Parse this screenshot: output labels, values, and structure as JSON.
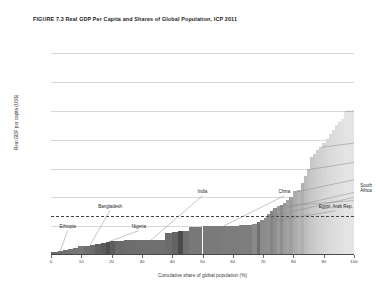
{
  "figure": {
    "title": "FIGURE 7.3 Real GDP Per Capita and Shares of Global Population, ICP 2011"
  },
  "chart_data": {
    "type": "bar",
    "title": "FIGURE 7.3 Real GDP Per Capita and Shares of Global Population, ICP 2011",
    "xlabel": "Cumulative share of global population (%)",
    "ylabel": "Real GDP per capita (US$)",
    "xlim": [
      0,
      100
    ],
    "ylim": [
      0,
      75000
    ],
    "grid": true,
    "legend": "none",
    "xticks": [
      0,
      10,
      20,
      30,
      40,
      50,
      60,
      70,
      80,
      90,
      100
    ],
    "xtick_labels": [
      "0",
      "10",
      "20",
      "30",
      "40",
      "50",
      "60",
      "70",
      "80",
      "90",
      "100"
    ],
    "yticks": [
      0,
      10000,
      20000,
      30000,
      40000,
      50000,
      60000,
      70000
    ],
    "ytick_labels": [
      "0",
      "10,000",
      "20,000",
      "30,000",
      "40,000",
      "50,000",
      "60,000",
      "70,000"
    ],
    "reference_line": {
      "label": "World average",
      "value_label": "13,460",
      "value": 13460,
      "style": "dashed"
    },
    "x_units": "cumulative share of global population (%)",
    "y_units": "Real GDP per capita (US$)",
    "note": "Skyline/Pen's-parade chart: each bar's width is a country's share of global population, height is its real GDP per capita. Bars sorted ascending by GDP per capita; shading lightens left to right.",
    "bars": [
      {
        "x0": 0.0,
        "x1": 2.2,
        "value": 1100,
        "shade": "#6b6b6b"
      },
      {
        "x0": 2.2,
        "x1": 4.0,
        "value": 1450,
        "shade": "#6e6e6e"
      },
      {
        "x0": 4.0,
        "x1": 5.6,
        "value": 1750,
        "shade": "#707070"
      },
      {
        "x0": 5.6,
        "x1": 7.2,
        "value": 2150,
        "shade": "#737373"
      },
      {
        "x0": 7.2,
        "x1": 9.0,
        "value": 2600,
        "shade": "#757575"
      },
      {
        "x0": 9.0,
        "x1": 11.0,
        "value": 3000,
        "shade": "#787878"
      },
      {
        "x0": 11.0,
        "x1": 12.8,
        "value": 3300,
        "shade": "#6f6f6f"
      },
      {
        "x0": 12.8,
        "x1": 14.6,
        "value": 3600,
        "shade": "#6b6b6b"
      },
      {
        "x0": 14.6,
        "x1": 16.4,
        "value": 3900,
        "shade": "#5f5f5f"
      },
      {
        "x0": 16.4,
        "x1": 18.0,
        "value": 4150,
        "shade": "#5a5a5a"
      },
      {
        "x0": 18.0,
        "x1": 19.6,
        "value": 4400,
        "shade": "#4e4e4e"
      },
      {
        "x0": 19.6,
        "x1": 21.0,
        "value": 4700,
        "shade": "#5d5d5d"
      },
      {
        "x0": 21.0,
        "x1": 24.0,
        "value": 4900,
        "shade": "#6a6a6a"
      },
      {
        "x0": 24.0,
        "x1": 28.0,
        "value": 5050,
        "shade": "#6d6d6d"
      },
      {
        "x0": 28.0,
        "x1": 33.0,
        "value": 5150,
        "shade": "#6f6f6f"
      },
      {
        "x0": 33.0,
        "x1": 37.5,
        "value": 5300,
        "shade": "#707070"
      },
      {
        "x0": 37.5,
        "x1": 40.0,
        "value": 7800,
        "shade": "#6c6c6c"
      },
      {
        "x0": 40.0,
        "x1": 41.8,
        "value": 8000,
        "shade": "#636363"
      },
      {
        "x0": 41.8,
        "x1": 43.5,
        "value": 8200,
        "shade": "#4a4a4a"
      },
      {
        "x0": 43.5,
        "x1": 45.5,
        "value": 8400,
        "shade": "#707070"
      },
      {
        "x0": 45.5,
        "x1": 50.0,
        "value": 9900,
        "shade": "#787878"
      },
      {
        "x0": 50.0,
        "x1": 56.0,
        "value": 10050,
        "shade": "#7a7a7a"
      },
      {
        "x0": 56.0,
        "x1": 62.0,
        "value": 10150,
        "shade": "#7c7c7c"
      },
      {
        "x0": 62.0,
        "x1": 66.5,
        "value": 10300,
        "shade": "#7e7e7e"
      },
      {
        "x0": 66.5,
        "x1": 68.0,
        "value": 10700,
        "shade": "#8a8a8a"
      },
      {
        "x0": 68.0,
        "x1": 69.0,
        "value": 11400,
        "shade": "#6e6e6e"
      },
      {
        "x0": 69.0,
        "x1": 70.2,
        "value": 12100,
        "shade": "#8b8b8b"
      },
      {
        "x0": 70.2,
        "x1": 71.2,
        "value": 13000,
        "shade": "#8d8d8d"
      },
      {
        "x0": 71.2,
        "x1": 72.2,
        "value": 14400,
        "shade": "#909090"
      },
      {
        "x0": 72.2,
        "x1": 73.4,
        "value": 15400,
        "shade": "#848484"
      },
      {
        "x0": 73.4,
        "x1": 74.6,
        "value": 16200,
        "shade": "#8e8e8e"
      },
      {
        "x0": 74.6,
        "x1": 75.6,
        "value": 16900,
        "shade": "#9a9a9a"
      },
      {
        "x0": 75.6,
        "x1": 76.6,
        "value": 17500,
        "shade": "#8d8d8d"
      },
      {
        "x0": 76.6,
        "x1": 77.6,
        "value": 18200,
        "shade": "#9c9c9c"
      },
      {
        "x0": 77.6,
        "x1": 78.6,
        "value": 19100,
        "shade": "#a2a2a2"
      },
      {
        "x0": 78.6,
        "x1": 79.8,
        "value": 20100,
        "shade": "#9e9e9e"
      },
      {
        "x0": 79.8,
        "x1": 81.2,
        "value": 22200,
        "shade": "#ababab"
      },
      {
        "x0": 81.2,
        "x1": 82.4,
        "value": 22600,
        "shade": "#b4b4b4"
      },
      {
        "x0": 82.4,
        "x1": 83.4,
        "value": 24900,
        "shade": "#b0b0b0"
      },
      {
        "x0": 83.4,
        "x1": 84.4,
        "value": 27500,
        "shade": "#bcbcbc"
      },
      {
        "x0": 84.4,
        "x1": 85.4,
        "value": 30000,
        "shade": "#c2c2c2"
      },
      {
        "x0": 85.4,
        "x1": 86.6,
        "value": 33900,
        "shade": "#c8c8c8"
      },
      {
        "x0": 86.6,
        "x1": 87.6,
        "value": 35000,
        "shade": "#cbcbcb"
      },
      {
        "x0": 87.6,
        "x1": 88.6,
        "value": 36400,
        "shade": "#cfcfcf"
      },
      {
        "x0": 88.6,
        "x1": 89.6,
        "value": 37600,
        "shade": "#d2d2d2"
      },
      {
        "x0": 89.6,
        "x1": 90.6,
        "value": 38800,
        "shade": "#d5d5d5"
      },
      {
        "x0": 90.6,
        "x1": 91.6,
        "value": 40200,
        "shade": "#d8d8d8"
      },
      {
        "x0": 91.6,
        "x1": 92.6,
        "value": 42000,
        "shade": "#dadada"
      },
      {
        "x0": 92.6,
        "x1": 93.6,
        "value": 43500,
        "shade": "#dcdcdc"
      },
      {
        "x0": 93.6,
        "x1": 94.6,
        "value": 45000,
        "shade": "#dedede"
      },
      {
        "x0": 94.6,
        "x1": 95.6,
        "value": 46200,
        "shade": "#e0e0e0"
      },
      {
        "x0": 95.6,
        "x1": 96.6,
        "value": 47400,
        "shade": "#e2e2e2"
      },
      {
        "x0": 96.6,
        "x1": 100.0,
        "value": 49800,
        "shade": "#e4e4e4"
      }
    ],
    "annotations": [
      {
        "label": "Ethiopia",
        "label_x": 5.5,
        "label_y": 9000,
        "point_x": 3.0,
        "point_y": 1200
      },
      {
        "label": "Bangladesh",
        "label_x": 19.5,
        "label_y": 16100,
        "point_x": 13.0,
        "point_y": 3600
      },
      {
        "label": "Nigeria",
        "label_x": 29.0,
        "label_y": 9000,
        "point_x": 18.3,
        "point_y": 4300
      },
      {
        "label": "India",
        "label_x": 50.0,
        "label_y": 21100,
        "point_x": 33.0,
        "point_y": 5200
      },
      {
        "label": "China",
        "label_x": 77.0,
        "label_y": 21100,
        "point_x": 57.0,
        "point_y": 10100
      },
      {
        "label": "Egypt, Arab Rep.",
        "label_x": 94.0,
        "label_y": 15900,
        "point_x": 67.3,
        "point_y": 10700
      },
      {
        "label": "South\nAfrica",
        "label_x": 104.0,
        "label_y": 21500,
        "point_x": 70.6,
        "point_y": 12900
      },
      {
        "label": "Brazil",
        "label_x": 111.0,
        "label_y": 24900,
        "point_x": 72.8,
        "point_y": 15200
      },
      {
        "label": "Mexico",
        "label_x": 124.0,
        "label_y": 21300,
        "point_x": 76.0,
        "point_y": 17000
      },
      {
        "label": "Russian Fed.",
        "label_x": 123.0,
        "label_y": 31700,
        "point_x": 80.5,
        "point_y": 21800
      },
      {
        "label": "Japan",
        "label_x": 131.0,
        "label_y": 37900,
        "point_x": 84.8,
        "point_y": 29600
      },
      {
        "label": "Germany",
        "label_x": 140.0,
        "label_y": 44700,
        "point_x": 89.2,
        "point_y": 37400
      },
      {
        "label": "United States",
        "label_x": 148.0,
        "label_y": 54000,
        "point_x": 97.0,
        "point_y": 49800
      }
    ]
  }
}
